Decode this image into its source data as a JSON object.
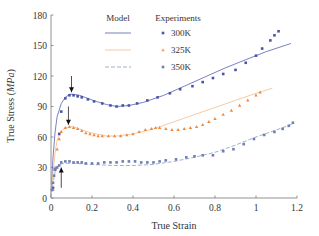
{
  "chart_data": {
    "type": "line",
    "title": "",
    "xlabel": "True Strain",
    "ylabel": "True Stress (MPa)",
    "ylabel_plain": "True Stress (",
    "ylabel_unit": "MPa",
    "ylabel_close": ")",
    "xlim": [
      0,
      1.2
    ],
    "ylim": [
      0,
      180
    ],
    "xticks": [
      0,
      0.2,
      0.4,
      0.6,
      0.8,
      1,
      1.2
    ],
    "xtick_labels": [
      "0",
      "0.2",
      "0.4",
      "0.6",
      "0.8",
      "1",
      "1.2"
    ],
    "yticks": [
      0,
      30,
      60,
      90,
      120,
      150,
      180
    ],
    "ytick_labels": [
      "0",
      "30",
      "60",
      "90",
      "120",
      "150",
      "180"
    ],
    "grid": false,
    "legend": {
      "position": "upper-center",
      "model_header": "Model",
      "experiments_header": "Experiments",
      "entries": [
        {
          "label": "300K",
          "color": "#4a55a8",
          "model_style": "solid",
          "marker": "square"
        },
        {
          "label": "325K",
          "color": "#f0a060",
          "model_style": "solid",
          "marker": "triangle"
        },
        {
          "label": "350K",
          "color": "#6d7fb4",
          "model_style": "dashed",
          "marker": "square"
        }
      ]
    },
    "annotations": [
      {
        "type": "arrow-down",
        "x": 0.1,
        "y_from": 120,
        "y_to": 104
      },
      {
        "type": "arrow-down",
        "x": 0.085,
        "y_from": 90,
        "y_to": 72
      },
      {
        "type": "arrow-up",
        "x": 0.05,
        "y_from": 10,
        "y_to": 30
      }
    ],
    "series": [
      {
        "name": "Model 300K",
        "kind": "model",
        "color": "#6a73b8",
        "dash": "",
        "x": [
          0,
          0.01,
          0.02,
          0.03,
          0.05,
          0.07,
          0.09,
          0.11,
          0.14,
          0.18,
          0.22,
          0.27,
          0.32,
          0.38,
          0.45,
          0.55,
          0.65,
          0.75,
          0.85,
          0.95,
          1.05,
          1.17
        ],
        "y": [
          0,
          40,
          65,
          80,
          93,
          99,
          102,
          102,
          101,
          98,
          95,
          92,
          90,
          91,
          94,
          101,
          110,
          119,
          128,
          136,
          144,
          152
        ]
      },
      {
        "name": "Model 325K",
        "kind": "model",
        "color": "#f4c49a",
        "dash": "",
        "x": [
          0,
          0.01,
          0.02,
          0.03,
          0.05,
          0.07,
          0.09,
          0.11,
          0.14,
          0.18,
          0.22,
          0.27,
          0.32,
          0.4,
          0.5,
          0.6,
          0.7,
          0.8,
          0.9,
          1.0,
          1.08
        ],
        "y": [
          0,
          25,
          45,
          57,
          66,
          69,
          70,
          70,
          68,
          65,
          63,
          61,
          61,
          63,
          68,
          75,
          82,
          89,
          96,
          103,
          108
        ]
      },
      {
        "name": "Model 350K",
        "kind": "model",
        "color": "#9aa6c8",
        "dash": "4,2",
        "x": [
          0,
          0.01,
          0.02,
          0.03,
          0.04,
          0.06,
          0.08,
          0.12,
          0.2,
          0.3,
          0.4,
          0.5,
          0.6,
          0.7,
          0.8,
          0.9,
          1.0,
          1.1,
          1.18
        ],
        "y": [
          0,
          15,
          26,
          31,
          33,
          34,
          34,
          34,
          33,
          32,
          32,
          33,
          36,
          40,
          45,
          52,
          60,
          67,
          73
        ]
      },
      {
        "name": "Experiments 300K",
        "kind": "experiment",
        "color": "#4a55a8",
        "marker": "square",
        "x": [
          0.01,
          0.02,
          0.04,
          0.05,
          0.07,
          0.09,
          0.11,
          0.13,
          0.15,
          0.18,
          0.21,
          0.25,
          0.29,
          0.32,
          0.35,
          0.38,
          0.42,
          0.47,
          0.52,
          0.58,
          0.63,
          0.69,
          0.74,
          0.79,
          0.84,
          0.9,
          0.95,
          1.0,
          1.03,
          1.07,
          1.09,
          1.11
        ],
        "y": [
          10,
          28,
          63,
          85,
          98,
          101,
          101,
          100,
          99,
          97,
          95,
          93,
          91,
          90,
          91,
          91,
          93,
          96,
          99,
          103,
          107,
          110,
          114,
          118,
          122,
          126,
          133,
          140,
          147,
          155,
          160,
          164
        ]
      },
      {
        "name": "Experiments 325K",
        "kind": "experiment",
        "color": "#f08a40",
        "marker": "triangle",
        "x": [
          0.01,
          0.02,
          0.03,
          0.04,
          0.05,
          0.07,
          0.09,
          0.11,
          0.13,
          0.15,
          0.17,
          0.19,
          0.21,
          0.23,
          0.25,
          0.28,
          0.31,
          0.34,
          0.37,
          0.4,
          0.43,
          0.46,
          0.49,
          0.51,
          0.53,
          0.56,
          0.59,
          0.62,
          0.65,
          0.68,
          0.71,
          0.74,
          0.77,
          0.8,
          0.84,
          0.88,
          0.92,
          0.96,
          1.0,
          1.02
        ],
        "y": [
          8,
          30,
          48,
          58,
          65,
          69,
          70,
          69,
          68,
          66,
          64,
          63,
          62,
          61,
          61,
          61,
          61,
          61,
          62,
          63,
          65,
          67,
          68,
          69,
          69,
          68,
          67,
          67,
          68,
          69,
          70,
          72,
          75,
          78,
          82,
          86,
          91,
          96,
          101,
          104
        ]
      },
      {
        "name": "Experiments 350K",
        "kind": "experiment",
        "color": "#6d7fb4",
        "marker": "square",
        "x": [
          0.005,
          0.01,
          0.015,
          0.02,
          0.03,
          0.04,
          0.05,
          0.07,
          0.09,
          0.11,
          0.13,
          0.15,
          0.17,
          0.2,
          0.23,
          0.26,
          0.29,
          0.32,
          0.35,
          0.38,
          0.41,
          0.44,
          0.47,
          0.5,
          0.53,
          0.56,
          0.61,
          0.66,
          0.7,
          0.74,
          0.79,
          0.84,
          0.89,
          0.94,
          0.99,
          1.04,
          1.09,
          1.13,
          1.16,
          1.18
        ],
        "y": [
          8,
          15,
          22,
          28,
          30,
          32,
          35,
          36,
          36,
          35,
          35,
          35,
          34,
          34,
          34,
          35,
          35,
          35,
          36,
          36,
          36,
          35,
          35,
          35,
          36,
          37,
          38,
          40,
          41,
          42,
          42,
          46,
          48,
          53,
          58,
          62,
          65,
          68,
          71,
          74
        ]
      }
    ]
  }
}
